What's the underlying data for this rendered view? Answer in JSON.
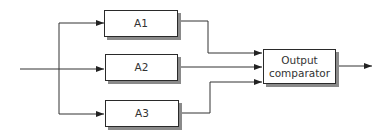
{
  "diagram": {
    "type": "block-diagram",
    "blocks": [
      {
        "id": "A1",
        "label": "A1"
      },
      {
        "id": "A2",
        "label": "A2"
      },
      {
        "id": "A3",
        "label": "A3"
      },
      {
        "id": "comparator",
        "label_line1": "Output",
        "label_line2": "comparator"
      }
    ],
    "edges": [
      {
        "from": "input",
        "to": "A1"
      },
      {
        "from": "input",
        "to": "A2"
      },
      {
        "from": "input",
        "to": "A3"
      },
      {
        "from": "A1",
        "to": "comparator"
      },
      {
        "from": "A2",
        "to": "comparator"
      },
      {
        "from": "A3",
        "to": "comparator"
      },
      {
        "from": "comparator",
        "to": "output"
      }
    ]
  }
}
